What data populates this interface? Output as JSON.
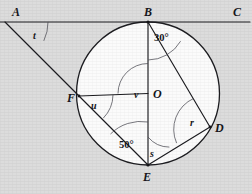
{
  "figure": {
    "background_color": "#dcdcdc",
    "circle_fill_color": "#fbfbfb",
    "line_color": "#1c1c20",
    "arc_color": "#4c4c54",
    "width": 252,
    "height": 194
  },
  "circle": {
    "center_label": "O",
    "center_x": 148,
    "center_y": 93.5,
    "radius": 71.5
  },
  "points": [
    {
      "id": "A",
      "label": "A",
      "x": 5,
      "y": 22,
      "label_x": 12,
      "label_y": 16
    },
    {
      "id": "B",
      "label": "B",
      "x": 148,
      "y": 22,
      "label_x": 144,
      "label_y": 16
    },
    {
      "id": "C",
      "label": "C",
      "x": 248,
      "y": 22,
      "label_x": 233,
      "label_y": 16
    },
    {
      "id": "O",
      "label": "O",
      "x": 148,
      "y": 93.5,
      "label_x": 153,
      "label_y": 97
    },
    {
      "id": "F",
      "label": "F",
      "x": 79,
      "y": 96,
      "label_x": 68,
      "label_y": 101
    },
    {
      "id": "D",
      "label": "D",
      "x": 210,
      "y": 127,
      "label_x": 215,
      "label_y": 131
    },
    {
      "id": "E",
      "label": "E",
      "x": 148,
      "y": 165,
      "label_x": 144,
      "label_y": 180
    }
  ],
  "segments": [
    {
      "name": "line-AC-tangent",
      "from": "A",
      "to": "C"
    },
    {
      "name": "segment-A-to-E",
      "from": "A",
      "to": "E"
    },
    {
      "name": "segment-B-to-E",
      "from": "B",
      "to": "E"
    },
    {
      "name": "segment-B-to-D",
      "from": "B",
      "to": "D"
    },
    {
      "name": "segment-F-to-O",
      "from": "F",
      "to": "O"
    },
    {
      "name": "segment-E-to-D",
      "from": "E",
      "to": "D"
    },
    {
      "name": "segment-O-to-E",
      "from": "O",
      "to": "E"
    }
  ],
  "angles": [
    {
      "id": "t",
      "label": "t",
      "vertex": "A",
      "label_x": 35,
      "label_y": 39,
      "value": null
    },
    {
      "id": "b30",
      "label": "30°",
      "vertex": "B",
      "label_x": 156,
      "label_y": 40,
      "value": "30"
    },
    {
      "id": "v",
      "label": "v",
      "vertex": "O",
      "label_x": 136,
      "label_y": 97,
      "value": null
    },
    {
      "id": "u",
      "label": "u",
      "vertex": "F",
      "label_x": 93,
      "label_y": 108,
      "value": null
    },
    {
      "id": "e50",
      "label": "50°",
      "vertex": "E",
      "label_x": 122,
      "label_y": 147,
      "value": "50"
    },
    {
      "id": "s",
      "label": "s",
      "vertex": "E",
      "label_x": 151,
      "label_y": 155,
      "value": null
    },
    {
      "id": "r",
      "label": "r",
      "vertex": "D",
      "label_x": 192,
      "label_y": 125,
      "value": null
    }
  ]
}
